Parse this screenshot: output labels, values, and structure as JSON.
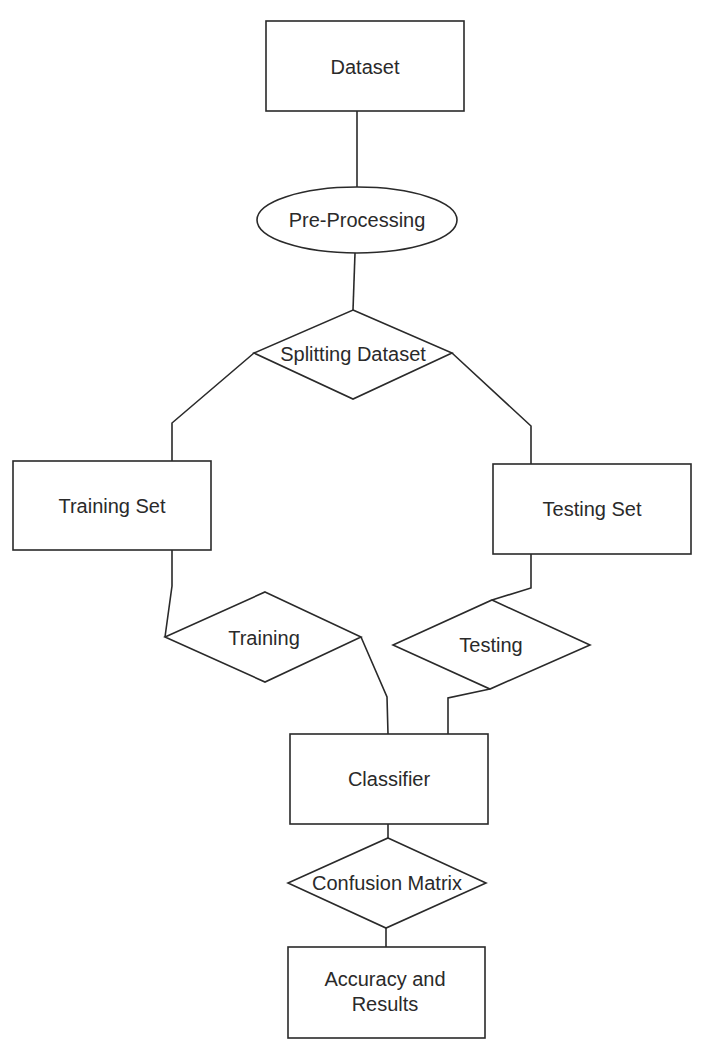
{
  "diagram": {
    "type": "flowchart",
    "colors": {
      "stroke": "#2a2a2a",
      "fill": "#ffffff",
      "text": "#2a2a2a"
    },
    "nodes": [
      {
        "id": "dataset",
        "shape": "rectangle",
        "label": "Dataset"
      },
      {
        "id": "preprocessing",
        "shape": "ellipse",
        "label": "Pre-Processing"
      },
      {
        "id": "splitting",
        "shape": "diamond",
        "label": "Splitting Dataset"
      },
      {
        "id": "training_set",
        "shape": "rectangle",
        "label": "Training Set"
      },
      {
        "id": "testing_set",
        "shape": "rectangle",
        "label": "Testing Set"
      },
      {
        "id": "training",
        "shape": "diamond",
        "label": "Training"
      },
      {
        "id": "testing",
        "shape": "diamond",
        "label": "Testing"
      },
      {
        "id": "classifier",
        "shape": "rectangle",
        "label": "Classifier"
      },
      {
        "id": "confusion",
        "shape": "diamond",
        "label": "Confusion Matrix"
      },
      {
        "id": "results",
        "shape": "rectangle",
        "label_lines": [
          "Accuracy and",
          "Results"
        ]
      }
    ],
    "edges": [
      {
        "from": "dataset",
        "to": "preprocessing"
      },
      {
        "from": "preprocessing",
        "to": "splitting"
      },
      {
        "from": "splitting",
        "to": "training_set"
      },
      {
        "from": "splitting",
        "to": "testing_set"
      },
      {
        "from": "training_set",
        "to": "training"
      },
      {
        "from": "testing_set",
        "to": "testing"
      },
      {
        "from": "training",
        "to": "classifier"
      },
      {
        "from": "testing",
        "to": "classifier"
      },
      {
        "from": "classifier",
        "to": "confusion"
      },
      {
        "from": "confusion",
        "to": "results"
      }
    ]
  }
}
